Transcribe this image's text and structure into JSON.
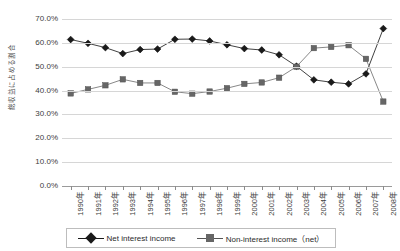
{
  "chart_data": {
    "type": "line",
    "title": "",
    "xlabel": "",
    "ylabel": "総収益に占める割合",
    "ylim": [
      0,
      70
    ],
    "ytick_labels": [
      "70.0%",
      "60.0%",
      "50.0%",
      "40.0%",
      "30.0%",
      "20.0%",
      "10.0%",
      "0.0%"
    ],
    "ytick_values": [
      70,
      60,
      50,
      40,
      30,
      20,
      10,
      0
    ],
    "grid": true,
    "legend_position": "bottom",
    "categories": [
      "1990年",
      "1991年",
      "1992年",
      "1993年",
      "1994年",
      "1995年",
      "1996年",
      "1997年",
      "1998年",
      "1999年",
      "2000年",
      "2001年",
      "2002年",
      "2003年",
      "2004年",
      "2005年",
      "2006年",
      "2007年",
      "2008年"
    ],
    "series": [
      {
        "name": "Net interest income",
        "color": "#1a1a1a",
        "marker": "diamond",
        "values": [
          61.4,
          59.8,
          58.0,
          55.5,
          57.2,
          57.4,
          61.5,
          61.6,
          60.8,
          59.2,
          57.6,
          57.0,
          55.0,
          50.2,
          44.5,
          43.5,
          42.8,
          47.0,
          66.0
        ]
      },
      {
        "name": "Non-interest income（net）",
        "color": "#666666",
        "marker": "square",
        "values": [
          38.8,
          40.5,
          42.2,
          44.7,
          43.2,
          43.2,
          39.5,
          38.7,
          39.6,
          41.0,
          42.8,
          43.4,
          45.4,
          50.0,
          57.8,
          58.3,
          59.0,
          53.3,
          35.4
        ]
      }
    ]
  },
  "legend": {
    "items": [
      {
        "label": "Net interest income",
        "color": "#1a1a1a",
        "marker": "diamond"
      },
      {
        "label": "Non-interest income（net）",
        "color": "#666666",
        "marker": "square"
      }
    ]
  },
  "colors": {
    "net_interest": "#1a1a1a",
    "non_interest": "#666666",
    "gridline": "#d6d6d6",
    "axis": "#9a9a9a",
    "text": "#3d3d3d",
    "background": "#ffffff"
  }
}
